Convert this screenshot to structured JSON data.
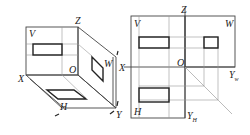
{
  "figure": {
    "left_view": {
      "title": "three-plane projection system (3D)",
      "labels": {
        "z": "Z",
        "v": "V",
        "o": "O",
        "w": "W",
        "x": "X",
        "h": "H",
        "y": "Y"
      }
    },
    "right_view": {
      "title": "three-plane projection unfolded",
      "labels": {
        "z": "Z",
        "v": "V",
        "w": "W",
        "o": "O",
        "x": "X",
        "yw_main": "Y",
        "yw_sub": "w",
        "h": "H",
        "yh_main": "Y",
        "yh_sub": "H"
      }
    },
    "colors": {
      "line": "#444444",
      "projection": "#222222",
      "guide": "#999999",
      "background": "#ffffff"
    }
  }
}
